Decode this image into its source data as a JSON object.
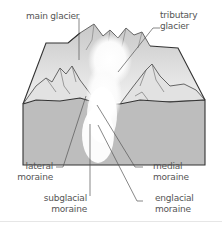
{
  "diagram": {
    "type": "block diagram of glacier with moraines",
    "labels": {
      "main_glacier": "main glacier",
      "tributary_glacier_line1": "tributary",
      "tributary_glacier_line2": "glacier",
      "lateral_line1": "lateral",
      "lateral_line2": "moraine",
      "medial_line1": "medial",
      "medial_line2": "moraine",
      "subglacial_line1": "subglacial",
      "subglacial_line2": "moraine",
      "englacial_line1": "englacial",
      "englacial_line2": "moraine"
    },
    "colors": {
      "outline": "#333333",
      "front_face": "#bdbdbd",
      "mountain_shade": "#d9d9d9",
      "glacier_ice": "#ffffff",
      "leader_line": "#555555",
      "text": "#555555"
    }
  }
}
